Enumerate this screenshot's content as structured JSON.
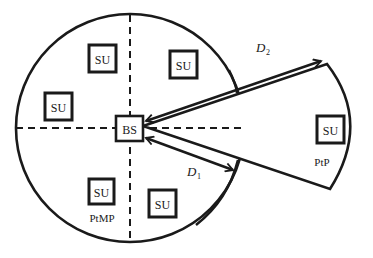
{
  "diagram": {
    "type": "network-topology",
    "coverage_regions": {
      "ptmp": {
        "label": "PtMP",
        "shape": "circle"
      },
      "ptp": {
        "label": "PtP",
        "shape": "sector"
      }
    },
    "base_station": {
      "label": "BS"
    },
    "subscriber_units": [
      {
        "id": "su1",
        "label": "SU",
        "region": "PtMP"
      },
      {
        "id": "su2",
        "label": "SU",
        "region": "PtMP"
      },
      {
        "id": "su3",
        "label": "SU",
        "region": "PtMP"
      },
      {
        "id": "su4",
        "label": "SU",
        "region": "PtMP"
      },
      {
        "id": "su5",
        "label": "SU",
        "region": "PtMP"
      },
      {
        "id": "su6",
        "label": "SU",
        "region": "PtP"
      }
    ],
    "distances": {
      "d1": {
        "label": "D",
        "subscript": "1"
      },
      "d2": {
        "label": "D",
        "subscript": "2"
      }
    },
    "colors": {
      "stroke": "#1a1a1a",
      "background": "#ffffff"
    }
  }
}
